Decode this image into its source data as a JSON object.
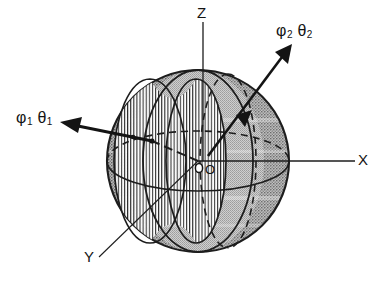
{
  "figure": {
    "kind": "geometry-diagram",
    "background": "#ffffff",
    "ink_color": "#141414",
    "sphere_fill": "#b9b9b9",
    "rim_color": "#6f6f6f",
    "hatch_color": "#2a2a2a"
  },
  "axes": {
    "z_label": "Z",
    "x_label": "X",
    "y_label": "Y",
    "origin_label": "O"
  },
  "rays": {
    "ray1": {
      "phi": "φ",
      "phi_sub": "1",
      "theta": "θ",
      "theta_sub": "1"
    },
    "ray2": {
      "phi": "φ",
      "phi_sub": "2",
      "theta": "θ",
      "theta_sub": "2"
    }
  },
  "caption": {
    "text": ""
  }
}
